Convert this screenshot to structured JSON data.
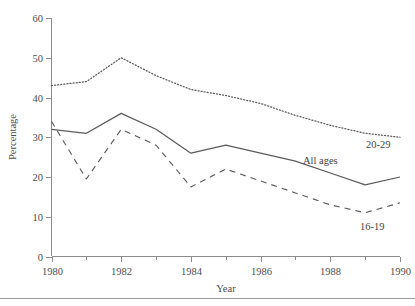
{
  "chart_data": {
    "type": "line",
    "title": "",
    "xlabel": "Year",
    "ylabel": "Percentage",
    "xlim": [
      1980,
      1990
    ],
    "ylim": [
      0,
      60
    ],
    "grid": false,
    "legend_position": "inline-end-of-line",
    "x_ticks": [
      1980,
      1982,
      1984,
      1986,
      1988,
      1990
    ],
    "x_tick_labels": [
      "1980",
      "1982",
      "1984",
      "1986",
      "1988",
      "1990"
    ],
    "x_minor_ticks": [
      1981,
      1983,
      1985,
      1987,
      1989
    ],
    "y_ticks": [
      0,
      10,
      20,
      30,
      40,
      50,
      60
    ],
    "y_tick_labels": [
      "0",
      "10",
      "20",
      "30",
      "40",
      "50",
      "60"
    ],
    "x": [
      1980,
      1981,
      1982,
      1983,
      1984,
      1985,
      1986,
      1987,
      1988,
      1989,
      1990
    ],
    "series": [
      {
        "name": "20-29",
        "label": "20-29",
        "style": "dotted",
        "color": "#5b5b5b",
        "values": [
          43.0,
          44.0,
          50.0,
          45.5,
          42.0,
          40.5,
          38.5,
          35.5,
          33.0,
          31.0,
          30.0
        ]
      },
      {
        "name": "All ages",
        "label": "All ages",
        "style": "solid",
        "color": "#5b5b5b",
        "values": [
          32.0,
          31.0,
          36.0,
          32.0,
          26.0,
          28.0,
          26.0,
          24.0,
          21.0,
          18.0,
          20.0
        ]
      },
      {
        "name": "16-19",
        "label": "16-19",
        "style": "dashed",
        "color": "#5b5b5b",
        "values": [
          34.0,
          19.5,
          32.0,
          28.0,
          17.5,
          22.0,
          19.0,
          16.0,
          13.0,
          11.0,
          13.5
        ]
      }
    ],
    "annotations": [
      {
        "text": "20-29",
        "x": 1990.1,
        "y": 26.5
      },
      {
        "text": "All ages",
        "x": 1987.6,
        "y": 23.5
      },
      {
        "text": "16-19",
        "x": 1989.9,
        "y": 7.5
      }
    ]
  }
}
